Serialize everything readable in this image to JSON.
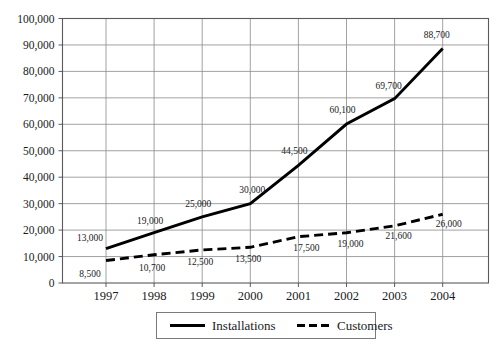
{
  "chart_data": {
    "type": "line",
    "title": "",
    "xlabel": "",
    "ylabel": "",
    "categories": [
      "1997",
      "1998",
      "1999",
      "2000",
      "2001",
      "2002",
      "2003",
      "2004"
    ],
    "ylim": [
      0,
      100000
    ],
    "ytick_interval": 10000,
    "ytick_labels": [
      "0",
      "10,000",
      "20,000",
      "30,000",
      "40,000",
      "50,000",
      "60,000",
      "70,000",
      "80,000",
      "90,000",
      "100,000"
    ],
    "ytick_values": [
      0,
      10000,
      20000,
      30000,
      40000,
      50000,
      60000,
      70000,
      80000,
      90000,
      100000
    ],
    "grid": true,
    "legend_position": "bottom",
    "series": [
      {
        "name": "Installations",
        "style": "solid",
        "color": "#000000",
        "values": [
          13000,
          19000,
          25000,
          30000,
          44500,
          60100,
          69700,
          88700
        ],
        "labels": [
          "13,000",
          "19,000",
          "25,000",
          "30,000",
          "44,500",
          "60,100",
          "69,700",
          "88,700"
        ]
      },
      {
        "name": "Customers",
        "style": "dashed",
        "color": "#000000",
        "values": [
          8500,
          10700,
          12500,
          13500,
          17500,
          19000,
          21600,
          26000
        ],
        "labels": [
          "8,500",
          "10,700",
          "12,500",
          "13,500",
          "17,500",
          "19,000",
          "21,600",
          "26,000"
        ]
      }
    ]
  },
  "legend": {
    "items": [
      {
        "label": "Installations",
        "style": "solid"
      },
      {
        "label": "Customers",
        "style": "dashed"
      }
    ]
  }
}
